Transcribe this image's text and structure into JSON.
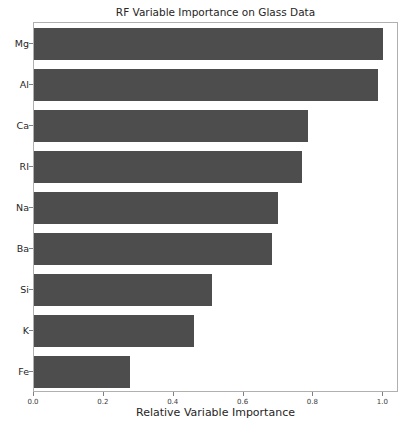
{
  "chart_data": {
    "type": "bar",
    "orientation": "horizontal",
    "title": "RF Variable Importance on Glass Data",
    "xlabel": "Relative Variable Importance",
    "ylabel": "",
    "categories": [
      "Mg",
      "Al",
      "Ca",
      "RI",
      "Na",
      "Ba",
      "Si",
      "K",
      "Fe"
    ],
    "values": [
      1.0,
      0.985,
      0.785,
      0.767,
      0.7,
      0.68,
      0.51,
      0.457,
      0.275
    ],
    "xlim": [
      0.0,
      1.045
    ],
    "xticks": [
      0.0,
      0.2,
      0.4,
      0.6,
      0.8,
      1.0
    ],
    "xtick_labels": [
      "0.0",
      "0.2",
      "0.4",
      "0.6",
      "0.8",
      "1.0"
    ],
    "ytick_labels": [
      "Mg",
      "Al",
      "Ca",
      "RI",
      "Na",
      "Ba",
      "Si",
      "K",
      "Fe"
    ],
    "grid": false,
    "legend": null,
    "bar_color": "#4d4d4d",
    "background_color": "#ffffff",
    "axes_edge_color": "#b0b0b0",
    "text_color": "#262626"
  }
}
